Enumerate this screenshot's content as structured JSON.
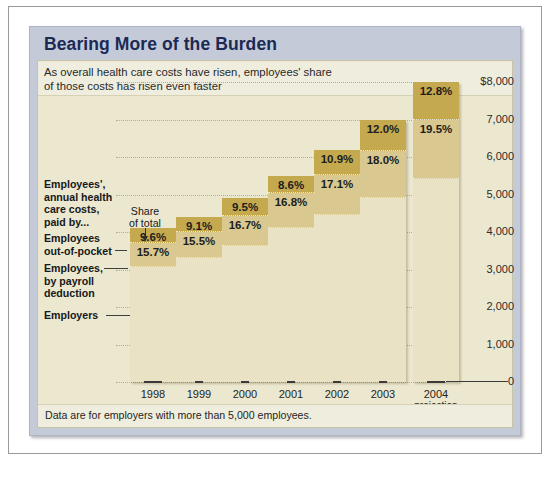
{
  "title": "Bearing More of the Burden",
  "intro": "As overall health care costs have risen, employees' share of those costs has risen even faster",
  "footnote": "Data are for employers with more than 5,000 employees.",
  "annotations": {
    "group_label": "Employees',\nannual health\ncare costs,\npaid by...",
    "group_label_l1": "Employees',",
    "group_label_l2": "annual health",
    "group_label_l3": "care costs,",
    "group_label_l4": "paid by...",
    "share_of_total_l1": "Share",
    "share_of_total_l2": "of total",
    "out_of_pocket_l1": "Employees",
    "out_of_pocket_l2": "out-of-pocket",
    "payroll_l1": "Employees,",
    "payroll_l2": "by payroll",
    "payroll_l3": "deduction",
    "employers": "Employers"
  },
  "colors": {
    "segment_out_of_pocket": "#c4a94f",
    "segment_payroll": "#d9c890",
    "segment_employers": "#e9e2c5",
    "panel": "#c5cad9",
    "chart_background": "#ece7cf",
    "title_text": "#1b2a55"
  },
  "chart_data": {
    "type": "bar",
    "stacked": true,
    "title": "Bearing More of the Burden",
    "subtitle": "As overall health care costs have risen, employees' share of those costs has risen even faster",
    "xlabel": "",
    "ylabel": "",
    "ylim": [
      0,
      8000
    ],
    "grid": true,
    "legend_position": "left-annotations",
    "categories": [
      "1998",
      "1999",
      "2000",
      "2001",
      "2002",
      "2003",
      "2004"
    ],
    "category_sublabels": [
      "",
      "",
      "",
      "",
      "",
      "",
      "projection"
    ],
    "ytick_labels": [
      "$8,000",
      "7,000",
      "6,000",
      "5,000",
      "4,000",
      "3,000",
      "2,000",
      "1,000",
      "0"
    ],
    "ytick_values": [
      8000,
      7000,
      6000,
      5000,
      4000,
      3000,
      2000,
      1000,
      0
    ],
    "totals": [
      4100,
      4400,
      4900,
      5500,
      6200,
      7000,
      8000
    ],
    "series": [
      {
        "name": "Employers",
        "color": "#e9e2c5",
        "share_percent": [
          74.7,
          75.4,
          73.8,
          74.6,
          72.0,
          70.0,
          67.7
        ],
        "values": [
          3063,
          3318,
          3616,
          4103,
          4464,
          4900,
          5416
        ]
      },
      {
        "name": "Employees, by payroll deduction",
        "color": "#d9c890",
        "share_percent": [
          15.7,
          15.5,
          16.7,
          16.8,
          17.1,
          18.0,
          19.5
        ],
        "labels": [
          "15.7%",
          "15.5%",
          "16.7%",
          "16.8%",
          "17.1%",
          "18.0%",
          "19.5%"
        ],
        "values": [
          644,
          682,
          818,
          924,
          1060,
          1260,
          1560
        ]
      },
      {
        "name": "Employees out-of-pocket",
        "color": "#c4a94f",
        "share_percent": [
          9.6,
          9.1,
          9.5,
          8.6,
          10.9,
          12.0,
          12.8
        ],
        "labels": [
          "9.6%",
          "9.1%",
          "9.5%",
          "8.6%",
          "10.9%",
          "12.0%",
          "12.8%"
        ],
        "values": [
          394,
          400,
          466,
          473,
          676,
          840,
          1024
        ]
      }
    ]
  }
}
